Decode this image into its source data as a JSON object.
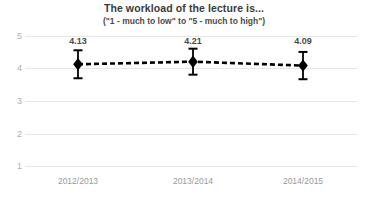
{
  "chart_data": {
    "type": "line",
    "title": "The workload of the lecture is...",
    "subtitle": "(\"1 -  much to low\" to \"5 - much to high\")",
    "xlabel": "",
    "ylabel": "",
    "categories": [
      "2012/2013",
      "2013/2014",
      "2014/2015"
    ],
    "values": [
      4.13,
      4.21,
      4.09
    ],
    "value_labels": [
      "4.13",
      "4.21",
      "4.09"
    ],
    "errors": [
      0.43,
      0.4,
      0.42
    ],
    "ylim": [
      1,
      5
    ],
    "yticks": [
      5,
      4,
      3,
      2,
      1
    ],
    "ytick_labels": [
      "5",
      "4",
      "3",
      "2",
      "1"
    ],
    "grid": true,
    "legend": false,
    "series": [
      {
        "name": "Mean rating",
        "values": [
          4.13,
          4.21,
          4.09
        ],
        "errors": [
          0.43,
          0.4,
          0.42
        ],
        "line_style": "dashed",
        "marker": "diamond",
        "color": "#000000"
      }
    ],
    "colors": {
      "line": "#000000",
      "marker": "#000000",
      "error_bar": "#000000",
      "grid": "#e6e6e6",
      "title_text": "#3a3a3a",
      "tick_text": "#9a9a9a",
      "background": "#ffffff"
    }
  }
}
